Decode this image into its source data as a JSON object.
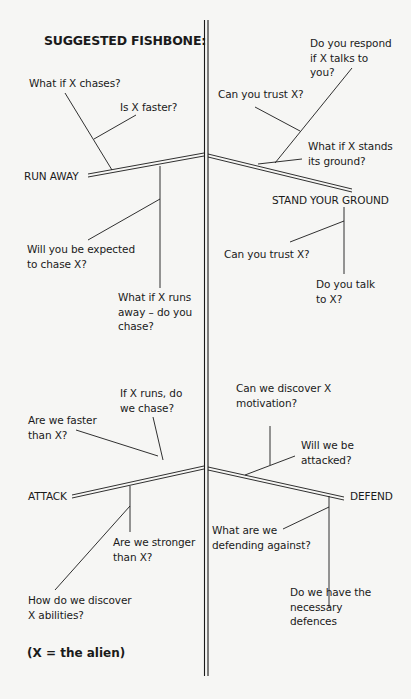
{
  "title": "SUGGESTED FISHBONE:",
  "footnote": "(X = the alien)",
  "categories": {
    "run_away": "RUN AWAY",
    "stand_your_ground": "STAND YOUR GROUND",
    "attack": "ATTACK",
    "defend": "DEFEND"
  },
  "questions": {
    "run_away": [
      "What if X chases?",
      "Is X faster?",
      "Will you be expected\nto chase X?",
      "What if X runs\naway – do you\nchase?"
    ],
    "stand_your_ground": [
      "Do you respond\nif X talks to\nyou?",
      "Can you trust X?",
      "What if X stands\nits ground?",
      "Can you trust X?",
      "Do you talk\nto X?"
    ],
    "attack": [
      "If X runs, do\nwe chase?",
      "Are we faster\nthan X?",
      "Are we stronger\nthan X?",
      "How do we discover\nX abilities?"
    ],
    "defend": [
      "Can we discover X\nmotivation?",
      "Will we be\nattacked?",
      "What are we\ndefending against?",
      "Do we have the\nnecessary\ndefences"
    ]
  },
  "colors": {
    "background": "#f6f6f4",
    "ink": "#1a1a1a"
  }
}
